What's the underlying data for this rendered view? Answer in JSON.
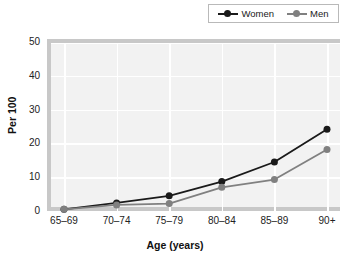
{
  "chart_data": {
    "type": "line",
    "title": "",
    "subtitle": "",
    "xlabel": "Age (years)",
    "ylabel": "Per 100",
    "categories": [
      "65–69",
      "70–74",
      "75–79",
      "80–84",
      "85–89",
      "90+"
    ],
    "series": [
      {
        "name": "Women",
        "color": "#1a1a1a",
        "values": [
          0.5,
          2.4,
          4.5,
          8.7,
          14.5,
          24.2
        ]
      },
      {
        "name": "Men",
        "color": "#808080",
        "values": [
          0.5,
          1.8,
          2.2,
          7.0,
          9.3,
          18.2
        ]
      }
    ],
    "ylim": [
      0,
      50
    ],
    "yticks": [
      0,
      10,
      20,
      30,
      40,
      50
    ],
    "ytick_labels": [
      "0",
      "10",
      "20",
      "30",
      "40",
      "50"
    ],
    "grid": true,
    "grid_color": "#ffffff",
    "plot_background": "#f2f2f2",
    "axis_frame_color": "#c8c8c8",
    "legend": {
      "position": "top-right",
      "entries": [
        {
          "label": "Women",
          "color": "#1a1a1a",
          "marker": "circle"
        },
        {
          "label": "Men",
          "color": "#808080",
          "marker": "circle"
        }
      ]
    }
  },
  "axis": {
    "ytick_labels": [
      "50",
      "40",
      "30",
      "20",
      "10",
      "0"
    ],
    "xtick_labels": [
      "65–69",
      "70–74",
      "75–79",
      "80–84",
      "85–89",
      "90+"
    ],
    "ylabel": "Per 100",
    "xlabel": "Age (years)"
  },
  "legend": {
    "women_label": "Women",
    "men_label": "Men"
  }
}
